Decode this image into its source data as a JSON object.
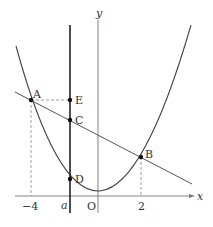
{
  "diagram": {
    "type": "coordinate-graph",
    "axes": {
      "x_label": "x",
      "y_label": "y",
      "origin_label": "O",
      "x_ticks": [
        "−4",
        "a",
        "2"
      ]
    },
    "points": {
      "A": {
        "label": "A",
        "x": -4
      },
      "B": {
        "label": "B",
        "x": 2
      },
      "C": {
        "label": "C"
      },
      "D": {
        "label": "D"
      },
      "E": {
        "label": "E"
      }
    },
    "colors": {
      "line": "#555555",
      "thick_line": "#222222",
      "dashed": "#888888",
      "point": "#111111"
    }
  }
}
